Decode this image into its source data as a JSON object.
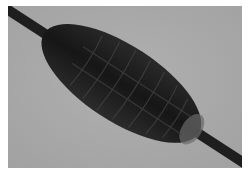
{
  "image": {
    "description": "Grayscale micrograph of a dark elongated segmented cocoon-like body on a diagonal rod against a light gray background",
    "colors": {
      "border": "#ffffff",
      "background": "#a9a9a9",
      "body": "#1a1a1a",
      "body_highlight": "#3a3a3a",
      "rod": "#222222",
      "end_cap": "#6e6e6e"
    }
  }
}
